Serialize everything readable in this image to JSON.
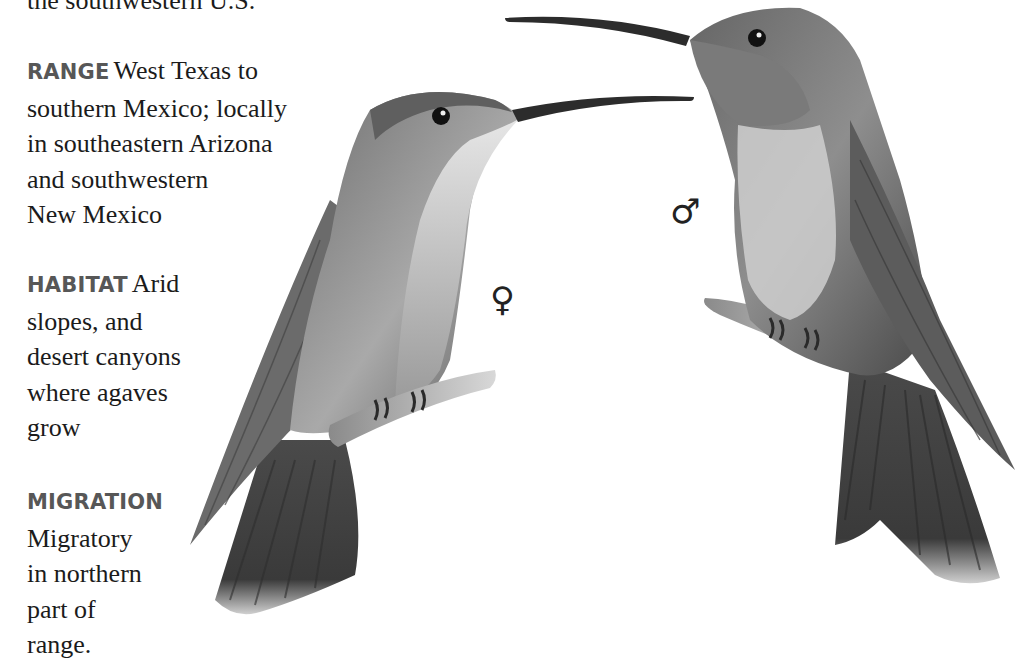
{
  "intro": {
    "cut_line": "the southwestern U.S."
  },
  "entries": {
    "range": {
      "label": "RANGE",
      "lines": [
        "West Texas to",
        "southern Mexico; locally",
        "in southeastern Arizona",
        "and southwestern",
        "New Mexico"
      ]
    },
    "habitat": {
      "label": "HABITAT",
      "lines": [
        "Arid",
        "slopes, and",
        "desert canyons",
        "where agaves",
        "grow"
      ]
    },
    "migration": {
      "label": "MIGRATION",
      "lines": [
        "Migratory",
        "in northern",
        "part of",
        "range."
      ]
    }
  },
  "illustration": {
    "female_symbol": "♀",
    "male_symbol": "♂",
    "female_label": "female-hummingbird",
    "male_label": "male-hummingbird",
    "colors": {
      "text": "#1b1b1b",
      "label": "#575757",
      "bird_dark": "#3a3a3a",
      "bird_mid": "#7a7a7a",
      "bird_light": "#c9c9c9"
    }
  }
}
